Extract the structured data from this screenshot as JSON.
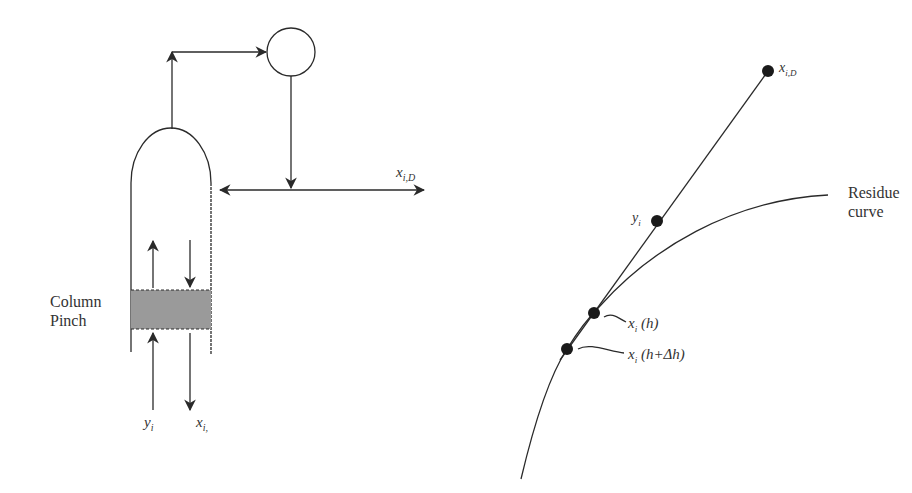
{
  "left_panel": {
    "title": "Column schematic",
    "labels": {
      "column_pinch_line1": "Column",
      "column_pinch_line2": "Pinch",
      "vapor_in": "y",
      "vapor_in_sub": "i",
      "liquid_out": "x",
      "liquid_out_sub": "i,",
      "distillate": "x",
      "distillate_sub": "i,D"
    },
    "colors": {
      "pinch_fill": "#9a9a9a",
      "line": "#2a2a2a"
    }
  },
  "right_panel": {
    "title": "Residue curve construction",
    "labels": {
      "residue_line1": "Residue",
      "residue_line2": "curve",
      "point_distillate": "x",
      "point_distillate_sub": "i,D",
      "point_vapor": "y",
      "point_vapor_sub": "i",
      "point_xh": "x",
      "point_xh_sub": "i",
      "point_xh_arg": " (h)",
      "point_xhdh": "x",
      "point_xhdh_sub": "i",
      "point_xhdh_arg": " (h+Δh)"
    },
    "points": [
      {
        "name": "x_iD",
        "x": 768,
        "y": 71
      },
      {
        "name": "y_i",
        "x": 657,
        "y": 221
      },
      {
        "name": "x_i(h)",
        "x": 594,
        "y": 313
      },
      {
        "name": "x_i(h+dh)",
        "x": 567,
        "y": 349
      }
    ]
  }
}
